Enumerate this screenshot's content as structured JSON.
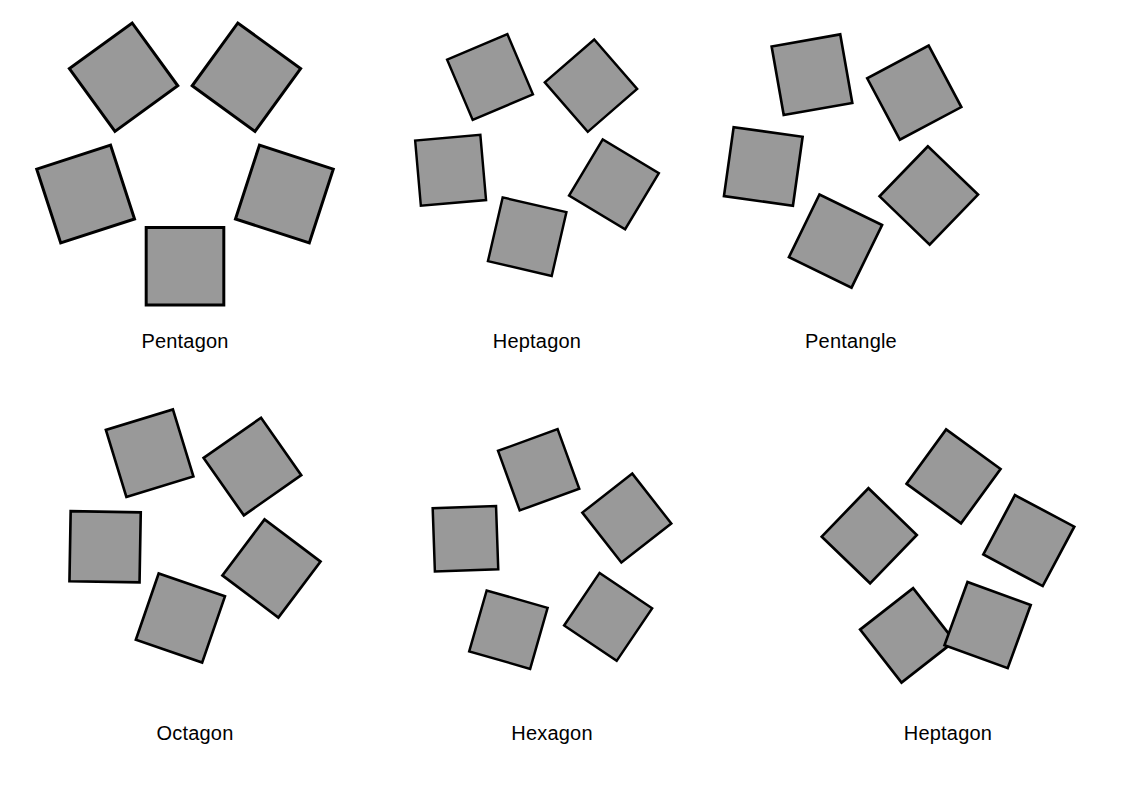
{
  "page": {
    "width": 1127,
    "height": 792,
    "background_color": "#ffffff",
    "kind": "geometric-figure-plate"
  },
  "style": {
    "square_fill": "#999999",
    "square_stroke": "#000000",
    "square_stroke_width": 3,
    "caption_color": "#000000",
    "caption_font_size": 20
  },
  "chart_data": {
    "type": "diagram",
    "title": "",
    "subtitle": "",
    "xlabel": "",
    "ylabel": "",
    "grid": false,
    "legend": "none",
    "figure_count": 6,
    "squares_per_figure": 5,
    "figures": [
      {
        "id": "pentagon",
        "caption": "Pentagon",
        "row": 0,
        "col": 0,
        "cell": {
          "x": 20,
          "y": 18,
          "width": 330,
          "height": 292
        },
        "caption_y": 330,
        "n_squares": 5,
        "ring_radius": 66,
        "square_side": 78,
        "twist_deg": 0,
        "phase_deg": 0,
        "center_opening": "regular pentagon",
        "note": "Squares erected outward on the sides of a regular pentagon; adjacent squares meet corner to corner."
      },
      {
        "id": "heptagon",
        "caption": "Heptagon",
        "row": 0,
        "col": 1,
        "cell": {
          "x": 392,
          "y": 30,
          "width": 290,
          "height": 250
        },
        "caption_y": 330,
        "n_squares": 5,
        "ring_radius": 66,
        "square_side": 80,
        "twist_deg": 13,
        "phase_deg": 0,
        "center_opening": "heptagon-like star opening",
        "note": "Each square twisted about its inner edge midpoint, opening a seven-sided notch at the centre."
      },
      {
        "id": "pentangle",
        "caption": "Pentangle",
        "row": 0,
        "col": 2,
        "cell": {
          "x": 706,
          "y": 30,
          "width": 290,
          "height": 262
        },
        "caption_y": 330,
        "n_squares": 5,
        "ring_radius": 64,
        "square_side": 80,
        "twist_deg": 26,
        "phase_deg": 0,
        "center_opening": "five-pointed star (pentagram)",
        "note": "Maximum twist; the central opening becomes a five-pointed star."
      },
      {
        "id": "octagon",
        "caption": "Octagon",
        "row": 1,
        "col": 0,
        "cell": {
          "x": 50,
          "y": 405,
          "width": 290,
          "height": 262
        },
        "caption_y": 722,
        "n_squares": 5,
        "ring_radius": 62,
        "square_side": 80,
        "twist_deg": 19,
        "phase_deg": 0,
        "center_opening": "octagon-like star opening",
        "note": "Intermediate twist; squares overlap at the lower corners."
      },
      {
        "id": "hexagon",
        "caption": "Hexagon",
        "row": 1,
        "col": 1,
        "cell": {
          "x": 404,
          "y": 425,
          "width": 296,
          "height": 248
        },
        "caption_y": 722,
        "n_squares": 5,
        "ring_radius": 66,
        "square_side": 76,
        "twist_deg": -20,
        "phase_deg": 36,
        "center_opening": "hexagon-like opening",
        "note": "Twist in the opposite sense; the lowest square stands on a corner like a diamond."
      },
      {
        "id": "heptagon-spiral",
        "caption": "Heptagon",
        "row": 1,
        "col": 2,
        "cell": {
          "x": 800,
          "y": 425,
          "width": 296,
          "height": 262
        },
        "caption_y": 722,
        "n_squares": 5,
        "ring_radius": 66,
        "square_side": 76,
        "twist_deg": 34,
        "phase_deg": 18,
        "spiral_step_deg": 10,
        "center_opening": "irregular seven-sided opening",
        "note": "Squares successively rotated in a spiral, giving an irregular seven-sided central opening."
      }
    ]
  },
  "captions": {
    "pentagon": "Pentagon",
    "heptagon": "Heptagon",
    "pentangle": "Pentangle",
    "octagon": "Octagon",
    "hexagon": "Hexagon",
    "heptagon_spiral": "Heptagon"
  }
}
